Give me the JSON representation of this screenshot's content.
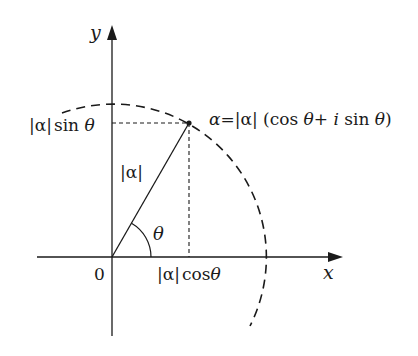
{
  "diagram": {
    "type": "complex-plane-polar-form",
    "axes": {
      "x_label": "x",
      "y_label": "y",
      "origin_label": "0"
    },
    "labels": {
      "point_formula": "α=|α| (cos θ+ i sin θ)",
      "point_formula_parts": {
        "alpha": "α",
        "eq": "=",
        "modulus": "|α|",
        "open": " (cos ",
        "theta1": "θ",
        "plus": "+ ",
        "i": "i",
        "sin": " sin ",
        "theta2": "θ",
        "close": ")"
      },
      "y_projection": {
        "modulus": "|α|",
        "func": "sin ",
        "theta": "θ"
      },
      "x_projection": {
        "modulus": "|α|",
        "func": "cos",
        "theta": "θ"
      },
      "radius": "|α|",
      "angle": "θ"
    },
    "geometry": {
      "origin": [
        112,
        257
      ],
      "point": [
        189,
        123
      ],
      "radius_px": 154,
      "arc_style": "dashed",
      "projection_style": "dashed"
    },
    "colors": {
      "ink": "#1a1a1a",
      "background": "#ffffff"
    }
  }
}
